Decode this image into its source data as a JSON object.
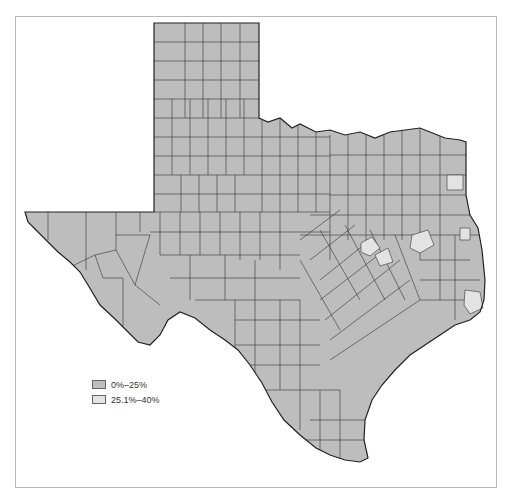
{
  "map": {
    "region": "Texas",
    "subdivision": "counties",
    "colors": {
      "low": "#bdbdbd",
      "high": "#e3e3e3",
      "border": "#333333",
      "frame": "#b8b8b8"
    }
  },
  "legend": {
    "items": [
      {
        "label": "0%–25%",
        "color": "#bdbdbd"
      },
      {
        "label": "25.1%–40%",
        "color": "#e3e3e3"
      }
    ]
  }
}
